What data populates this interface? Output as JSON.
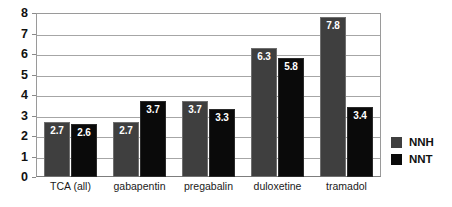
{
  "chart_data": {
    "type": "bar",
    "title": "",
    "xlabel": "",
    "ylabel": "",
    "ylim": [
      0,
      8
    ],
    "ytick_step": 1,
    "yticks": [
      "8",
      "7",
      "6",
      "5",
      "4",
      "3",
      "2",
      "1",
      "0"
    ],
    "grid": true,
    "legend_position": "right",
    "categories": [
      "TCA (all)",
      "gabapentin",
      "pregabalin",
      "duloxetine",
      "tramadol"
    ],
    "series": [
      {
        "name": "NNH",
        "color": "#3f3f3f",
        "values": [
          2.7,
          2.7,
          3.7,
          6.3,
          7.8
        ],
        "labels": [
          "2.7",
          "2.7",
          "3.7",
          "6.3",
          "7.8"
        ]
      },
      {
        "name": "NNT",
        "color": "#0a0a0a",
        "values": [
          2.6,
          3.7,
          3.3,
          5.8,
          3.4
        ],
        "labels": [
          "2.6",
          "3.7",
          "3.3",
          "5.8",
          "3.4"
        ]
      }
    ]
  },
  "legend": {
    "items": [
      {
        "label": "NNH",
        "color": "#3f3f3f"
      },
      {
        "label": "NNT",
        "color": "#0a0a0a"
      }
    ]
  }
}
